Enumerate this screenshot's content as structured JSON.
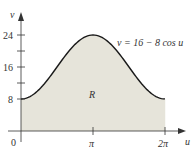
{
  "chart_data": {
    "type": "area",
    "title": "",
    "xlabel": "u",
    "ylabel": "v",
    "function_label": "v = 16 − 8 cos u",
    "region_label": "R",
    "x_ticks": [
      {
        "value": 0,
        "label": "0"
      },
      {
        "value": 3.14159,
        "label": "π"
      },
      {
        "value": 6.28318,
        "label": "2π"
      }
    ],
    "y_ticks": [
      {
        "value": 8,
        "label": "8"
      },
      {
        "value": 12,
        "label": ""
      },
      {
        "value": 16,
        "label": "16"
      },
      {
        "value": 20,
        "label": ""
      },
      {
        "value": 24,
        "label": "24"
      }
    ],
    "xlim": [
      0,
      6.28318
    ],
    "ylim": [
      0,
      24
    ],
    "x": [
      0,
      0.785,
      1.571,
      2.356,
      3.142,
      3.927,
      4.712,
      5.498,
      6.283
    ],
    "values": [
      8,
      10.34,
      16,
      21.66,
      24,
      21.66,
      16,
      10.34,
      8
    ],
    "grid": false,
    "legend": "none",
    "colors": {
      "fill": "#e6e4da",
      "curve": "#1a1a1a",
      "axis": "#333333"
    }
  }
}
